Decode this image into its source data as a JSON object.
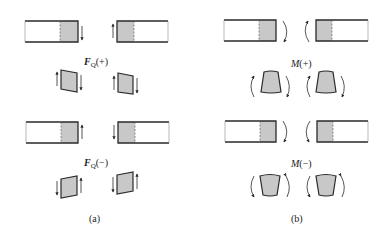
{
  "figure": {
    "panel_a": {
      "caption": "(a)",
      "quantity_symbol": "F",
      "quantity_subscript": "Q",
      "positive_label": "(+)",
      "negative_label": "(−)"
    },
    "panel_b": {
      "caption": "(b)",
      "quantity_symbol": "M",
      "positive_label": "(+)",
      "negative_label": "(−)"
    }
  },
  "colors": {
    "stroke": "#2a2a2a",
    "fill_gray": "#c8c8c8",
    "background": "#ffffff"
  }
}
